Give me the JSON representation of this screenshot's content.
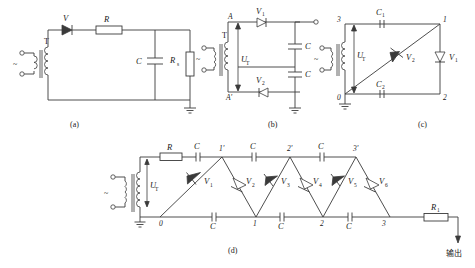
{
  "figure": {
    "title_caption_a": "(a)",
    "title_caption_b": "(b)",
    "title_caption_c": "(c)",
    "title_caption_d": "(d)"
  },
  "circuit_a": {
    "name": "half-wave-rectifier",
    "transformer": "T",
    "ac_source": "~",
    "diode": "V",
    "resistor": "R",
    "capacitor": "C",
    "load_resistor": "R",
    "load_resistor_sub": "s",
    "caption": "(a)"
  },
  "circuit_b": {
    "name": "voltage-doubler",
    "transformer": "T",
    "ac_source": "~",
    "node_a": "A",
    "node_a_prime": "A'",
    "voltage_label": "U",
    "voltage_sub": "T",
    "diode1": "V",
    "diode1_sub": "1",
    "diode2": "V",
    "diode2_sub": "2",
    "cap1": "C",
    "cap2": "C",
    "caption": "(b)"
  },
  "circuit_c": {
    "name": "bridge-doubler",
    "transformer": "T",
    "ac_source": "~",
    "voltage_label": "U",
    "voltage_sub": "T",
    "cap1": "C",
    "cap1_sub": "1",
    "cap2": "C",
    "cap2_sub": "2",
    "diode1": "V",
    "diode1_sub": "1",
    "diode2": "V",
    "diode2_sub": "2",
    "node_0": "0",
    "node_1": "1",
    "node_2": "2",
    "node_3": "3",
    "caption": "(c)"
  },
  "circuit_d": {
    "name": "cockcroft-walton-multiplier",
    "transformer": "T",
    "ac_source": "~",
    "series_resistor": "R",
    "voltage_label": "U",
    "voltage_sub": "T",
    "output_resistor": "R",
    "output_resistor_sub": "1",
    "output_text": "输出",
    "cap_label": "C",
    "top_caps": [
      "C",
      "C",
      "C"
    ],
    "bottom_caps": [
      "C",
      "C",
      "C"
    ],
    "top_nodes": [
      "1'",
      "2'",
      "3'"
    ],
    "bottom_nodes": [
      "0",
      "1",
      "2",
      "3"
    ],
    "diodes": [
      {
        "label": "V",
        "sub": "1"
      },
      {
        "label": "V",
        "sub": "2"
      },
      {
        "label": "V",
        "sub": "3"
      },
      {
        "label": "V",
        "sub": "4"
      },
      {
        "label": "V",
        "sub": "5"
      },
      {
        "label": "V",
        "sub": "6"
      }
    ],
    "caption": "(d)"
  },
  "colors": {
    "wire": "#3a3a3a",
    "background": "#ffffff",
    "text": "#1a1a1a"
  }
}
